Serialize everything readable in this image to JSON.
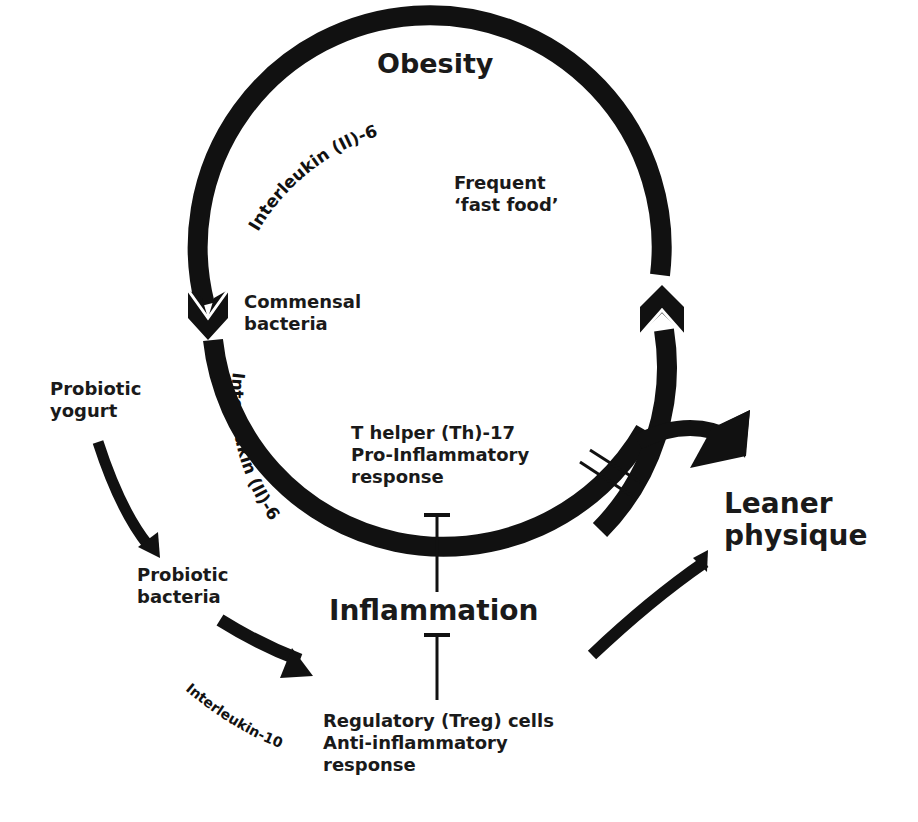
{
  "diagram": {
    "title": "Obesity",
    "nodes": {
      "obesity": "Obesity",
      "fast_food_line1": "Frequent",
      "fast_food_line2": "‘fast food’",
      "commensal_line1": "Commensal",
      "commensal_line2": "bacteria",
      "th17_line1": "T helper (Th)-17",
      "th17_line2": "Pro-Inflammatory",
      "th17_line3": "response",
      "inflammation": "Inflammation",
      "probiotic_yogurt_line1": "Probiotic",
      "probiotic_yogurt_line2": "yogurt",
      "probiotic_bacteria_line1": "Probiotic",
      "probiotic_bacteria_line2": "bacteria",
      "treg_line1": "Regulatory (Treg) cells",
      "treg_line2": "Anti-inflammatory",
      "treg_line3": "response",
      "leaner_line1": "Leaner",
      "leaner_line2": "physique"
    },
    "edge_labels": {
      "il6_top": "Interleukin (Il)-6",
      "il6_left": "Interleukin (Il)-6",
      "il10": "Interleukin-10"
    },
    "edges": [
      {
        "from": "Obesity",
        "to": "Commensal bacteria",
        "label": "Interleukin (Il)-6",
        "type": "arrow"
      },
      {
        "from": "Commensal bacteria",
        "to": "T helper (Th)-17 Pro-Inflammatory response",
        "label": "Interleukin (Il)-6",
        "type": "arrow"
      },
      {
        "from": "Frequent 'fast food'",
        "to": "Obesity",
        "type": "arrow"
      },
      {
        "from": "Cycle",
        "to": "Leaner physique",
        "type": "blocked-arrow"
      },
      {
        "from": "Probiotic yogurt",
        "to": "Probiotic bacteria",
        "type": "arrow"
      },
      {
        "from": "Probiotic bacteria",
        "to": "Regulatory (Treg) cells",
        "label": "Interleukin-10",
        "type": "arrow"
      },
      {
        "from": "T helper (Th)-17",
        "to": "Inflammation",
        "type": "inhibit"
      },
      {
        "from": "Regulatory (Treg) cells",
        "to": "Inflammation",
        "type": "inhibit"
      },
      {
        "from": "Regulatory (Treg) cells",
        "to": "Leaner physique",
        "type": "arrow"
      }
    ],
    "colors": {
      "ink": "#111111",
      "background": "#ffffff"
    }
  }
}
